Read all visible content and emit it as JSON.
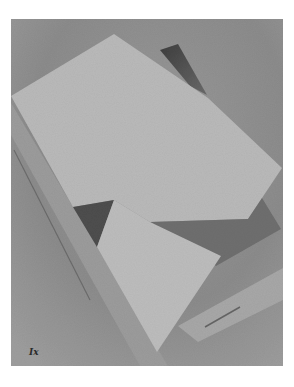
{
  "artwork": {
    "description": "Grayscale reproduction of an abstract geometric composition of overlapping planes",
    "plate_label": "Ix",
    "frame": {
      "x": 11,
      "y": 19,
      "width": 272,
      "height": 347
    },
    "colors": {
      "page": "#ffffff",
      "background": "#8e8e8e",
      "background_dark": "#7a7a7a",
      "light_plane": "#bababa",
      "light_triangle": "#bdbdbd",
      "dark_triangle": "#4e4e4e",
      "top_dark_wedge": "#444444",
      "medium_plane": "#6f6f6f",
      "left_band": "#9a9a9a",
      "lower_right_band": "#a6a6a6",
      "stripe": "#5a5a5a"
    },
    "shapes": [
      {
        "name": "large-light-plane",
        "points": "114,34 208,98 282,168 248,219 150,222 114,200 73,207 11,96"
      },
      {
        "name": "top-dark-wedge",
        "points": "166,48 178,44 206,94 200,92"
      },
      {
        "name": "dark-triangle",
        "points": "73,207 114,200 97,247"
      },
      {
        "name": "medium-gray-plane",
        "points": "150,222 248,219 262,198 281,229 216,266"
      },
      {
        "name": "lower-light-triangle",
        "points": "114,200 150,222 221,256 157,352 97,247"
      },
      {
        "name": "left-diagonal-band",
        "points": "11,103 11,130 140,366 165,366"
      },
      {
        "name": "lower-right-band",
        "points": "283,270 283,300 200,340 180,325"
      }
    ]
  }
}
